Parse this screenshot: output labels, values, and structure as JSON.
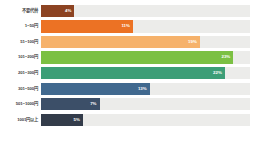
{
  "chart_data": {
    "type": "bar",
    "orientation": "horizontal",
    "title": "",
    "xlabel": "",
    "ylabel": "",
    "grid": false,
    "legend": "none",
    "axis_max_percent": 25,
    "track_color": "#ececea",
    "background": "#ffffff",
    "categories": [
      "不要代替",
      "1~50円",
      "51~100円",
      "101~200円",
      "201~300円",
      "301~500円",
      "501~1000円",
      "1001円以上"
    ],
    "values": [
      4,
      11,
      19,
      23,
      22,
      13,
      7,
      5
    ],
    "value_labels": [
      "4%",
      "11%",
      "19%",
      "23%",
      "22%",
      "13%",
      "7%",
      "5%"
    ],
    "colors": [
      "#8c4322",
      "#ec7224",
      "#f6b26b",
      "#7bc043",
      "#3c9e77",
      "#41698f",
      "#3c4f68",
      "#333c4a"
    ],
    "bars": [
      {
        "label": "不要代替",
        "value": 4,
        "value_label": "4%",
        "color": "#8c4322"
      },
      {
        "label": "1~50円",
        "value": 11,
        "value_label": "11%",
        "color": "#ec7224"
      },
      {
        "label": "51~100円",
        "value": 19,
        "value_label": "19%",
        "color": "#f6b26b"
      },
      {
        "label": "101~200円",
        "value": 23,
        "value_label": "23%",
        "color": "#7bc043"
      },
      {
        "label": "201~300円",
        "value": 22,
        "value_label": "22%",
        "color": "#3c9e77"
      },
      {
        "label": "301~500円",
        "value": 13,
        "value_label": "13%",
        "color": "#41698f"
      },
      {
        "label": "501~1000円",
        "value": 7,
        "value_label": "7%",
        "color": "#3c4f68"
      },
      {
        "label": "1001円以上",
        "value": 5,
        "value_label": "5%",
        "color": "#333c4a"
      }
    ]
  }
}
